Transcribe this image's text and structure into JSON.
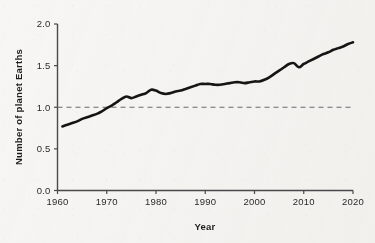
{
  "chart_data": {
    "type": "line",
    "title": "",
    "xlabel": "Year",
    "ylabel": "Number of planet Earths",
    "xlim": [
      1960,
      2020
    ],
    "ylim": [
      0.0,
      2.0
    ],
    "xticks": [
      1960,
      1970,
      1980,
      1990,
      2000,
      2010,
      2020
    ],
    "xtick_labels": [
      "1960",
      "1970",
      "1980",
      "1990",
      "2000",
      "2010",
      "2020"
    ],
    "yticks": [
      0.0,
      0.5,
      1.0,
      1.5,
      2.0
    ],
    "ytick_labels": [
      "0.0",
      "0.5",
      "1.0",
      "1.5",
      "2.0"
    ],
    "grid": false,
    "legend": "none",
    "line_color": "#151515",
    "line_width": 2.6,
    "background_color": "#f7f6f4",
    "axis_color": "#4a4a4a",
    "annotations": [
      {
        "kind": "hline",
        "name": "one-earth-threshold",
        "y": 1.0,
        "style": "dashed",
        "color": "#6b6b6b",
        "label": ""
      }
    ],
    "x": [
      1961,
      1962,
      1963,
      1964,
      1965,
      1966,
      1967,
      1968,
      1969,
      1970,
      1971,
      1972,
      1973,
      1974,
      1975,
      1976,
      1977,
      1978,
      1979,
      1980,
      1981,
      1982,
      1983,
      1984,
      1985,
      1986,
      1987,
      1988,
      1989,
      1990,
      1991,
      1992,
      1993,
      1994,
      1995,
      1996,
      1997,
      1998,
      1999,
      2000,
      2001,
      2002,
      2003,
      2004,
      2005,
      2006,
      2007,
      2008,
      2009,
      2010,
      2011,
      2012,
      2013,
      2014,
      2015,
      2016,
      2017,
      2018,
      2019,
      2020
    ],
    "y": [
      0.77,
      0.79,
      0.81,
      0.83,
      0.86,
      0.88,
      0.9,
      0.92,
      0.95,
      0.99,
      1.02,
      1.06,
      1.1,
      1.13,
      1.11,
      1.13,
      1.15,
      1.17,
      1.21,
      1.2,
      1.17,
      1.16,
      1.17,
      1.19,
      1.2,
      1.22,
      1.24,
      1.26,
      1.28,
      1.28,
      1.28,
      1.27,
      1.27,
      1.28,
      1.29,
      1.3,
      1.3,
      1.29,
      1.3,
      1.31,
      1.31,
      1.33,
      1.36,
      1.4,
      1.44,
      1.48,
      1.52,
      1.53,
      1.48,
      1.52,
      1.55,
      1.58,
      1.61,
      1.64,
      1.66,
      1.69,
      1.71,
      1.73,
      1.76,
      1.78
    ],
    "series": [
      {
        "name": "Humanity's Ecological Footprint",
        "values": [
          0.77,
          0.79,
          0.81,
          0.83,
          0.86,
          0.88,
          0.9,
          0.92,
          0.95,
          0.99,
          1.02,
          1.06,
          1.1,
          1.13,
          1.11,
          1.13,
          1.15,
          1.17,
          1.21,
          1.2,
          1.17,
          1.16,
          1.17,
          1.19,
          1.2,
          1.22,
          1.24,
          1.26,
          1.28,
          1.28,
          1.28,
          1.27,
          1.27,
          1.28,
          1.29,
          1.3,
          1.3,
          1.29,
          1.3,
          1.31,
          1.31,
          1.33,
          1.36,
          1.4,
          1.44,
          1.48,
          1.52,
          1.53,
          1.48,
          1.52,
          1.55,
          1.58,
          1.61,
          1.64,
          1.66,
          1.69,
          1.71,
          1.73,
          1.76,
          1.78
        ]
      }
    ]
  }
}
